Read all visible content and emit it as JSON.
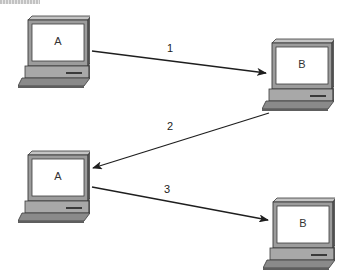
{
  "diagram": {
    "type": "network-communication-sequence",
    "nodes": [
      {
        "id": "a1",
        "label": "A",
        "kind": "computer",
        "x": 18,
        "y": 14
      },
      {
        "id": "b1",
        "label": "B",
        "kind": "computer",
        "x": 262,
        "y": 37
      },
      {
        "id": "a2",
        "label": "A",
        "kind": "computer",
        "x": 18,
        "y": 149
      },
      {
        "id": "b2",
        "label": "B",
        "kind": "computer",
        "x": 263,
        "y": 196
      }
    ],
    "edges": [
      {
        "label": "1",
        "from": "a1",
        "to": "b1"
      },
      {
        "label": "2",
        "from": "b1",
        "to": "a2"
      },
      {
        "label": "3",
        "from": "a2",
        "to": "b2"
      }
    ]
  },
  "colors": {
    "background": "#ffffff",
    "screen": "#ffffff",
    "casing": "#9c9c9c",
    "casing_dark": "#5e5e5e",
    "casing_light": "#c4c4c4",
    "outline": "#3a3a3a",
    "arrow": "#1e1e1e"
  }
}
